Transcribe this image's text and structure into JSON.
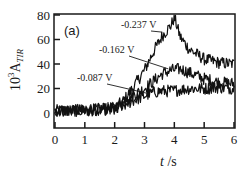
{
  "chart_data": {
    "type": "line",
    "title": "",
    "panel_label": "(a)",
    "xlabel": "t /s",
    "xlabel_italic": "t",
    "xlabel_unit": " /s",
    "ylabel": "10^3 A_TIR",
    "ylabel_parts": {
      "base": "10",
      "exp": "3",
      "sym": "A",
      "sub": "TIR"
    },
    "xlim": [
      0,
      6
    ],
    "ylim": [
      -7,
      80
    ],
    "xticks": [
      0,
      1,
      2,
      3,
      4,
      5,
      6
    ],
    "yticks": [
      0,
      20,
      40,
      60,
      80
    ],
    "grid": false,
    "legend": "inline annotations with leader lines",
    "series": [
      {
        "name": "-0.237 V",
        "x": [
          0,
          0.5,
          1.0,
          1.5,
          2.0,
          2.3,
          2.6,
          3.0,
          3.3,
          3.6,
          3.9,
          4.0,
          4.2,
          4.5,
          5.0,
          5.5,
          6.0
        ],
        "values": [
          2,
          2,
          2,
          3,
          4,
          10,
          20,
          35,
          50,
          63,
          72,
          78,
          62,
          52,
          44,
          41,
          40
        ]
      },
      {
        "name": "-0.162 V",
        "x": [
          0,
          0.5,
          1.0,
          1.5,
          2.0,
          2.3,
          2.6,
          3.0,
          3.3,
          3.6,
          3.9,
          4.2,
          4.5,
          5.0,
          5.5,
          6.0
        ],
        "values": [
          2,
          2,
          2,
          3,
          4,
          8,
          14,
          20,
          26,
          32,
          35,
          36,
          33,
          28,
          25,
          24
        ]
      },
      {
        "name": "-0.087 V",
        "x": [
          0,
          0.5,
          1.0,
          1.5,
          2.0,
          2.3,
          2.6,
          3.0,
          3.3,
          3.6,
          3.9,
          4.2,
          4.5,
          5.0,
          5.5,
          6.0
        ],
        "values": [
          2,
          2,
          2,
          3,
          3,
          6,
          10,
          14,
          17,
          18,
          18,
          19,
          20,
          20,
          21,
          20
        ]
      }
    ],
    "annotations": [
      {
        "text": "-0.237 V",
        "x_px": 121,
        "y_px": 28,
        "arrow_to": [
          3.6,
          66
        ]
      },
      {
        "text": "-0.162 V",
        "x_px": 99,
        "y_px": 53,
        "arrow_to": [
          3.8,
          36
        ]
      },
      {
        "text": "-0.087 V",
        "x_px": 77,
        "y_px": 81,
        "arrow_to": [
          3.1,
          16
        ]
      }
    ],
    "noise_amplitude": 5
  }
}
